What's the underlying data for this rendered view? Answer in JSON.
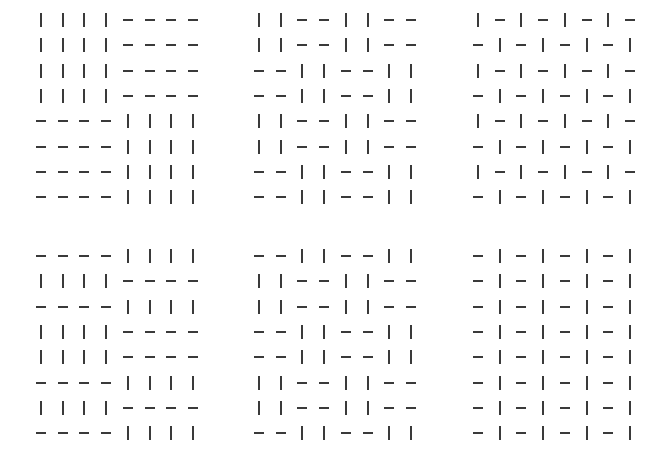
{
  "figure": {
    "line_color": "#3a3a3a",
    "background": "#ffffff",
    "panels": [
      {
        "id": "top-left",
        "rows": [
          "||||----",
          "||||----",
          "||||----",
          "||||----",
          "----||||",
          "----||||",
          "----||||",
          "----||||"
        ]
      },
      {
        "id": "top-middle",
        "rows": [
          "||--||--",
          "||--||--",
          "--||--||",
          "--||--||",
          "||--||--",
          "||--||--",
          "--||--||",
          "--||--||"
        ]
      },
      {
        "id": "top-right",
        "rows": [
          "|-|-|-|-",
          "-|-|-|-|",
          "|-|-|-|-",
          "-|-|-|-|",
          "|-|-|-|-",
          "-|-|-|-|",
          "|-|-|-|-",
          "-|-|-|-|"
        ]
      },
      {
        "id": "bottom-left",
        "rows": [
          "----||||",
          "||||----",
          "----||||",
          "||||----",
          "||||----",
          "----||||",
          "||||----",
          "----||||"
        ]
      },
      {
        "id": "bottom-middle",
        "rows": [
          "--||--||",
          "||--||--",
          "||--||--",
          "--||--||",
          "--||--||",
          "||--||--",
          "||--||--",
          "--||--||"
        ]
      },
      {
        "id": "bottom-right",
        "rows": [
          "-|-|-|-|",
          "-|-|-|-|",
          "-|-|-|-|",
          "-|-|-|-|",
          "-|-|-|-|",
          "-|-|-|-|",
          "-|-|-|-|",
          "-|-|-|-|"
        ]
      }
    ]
  }
}
